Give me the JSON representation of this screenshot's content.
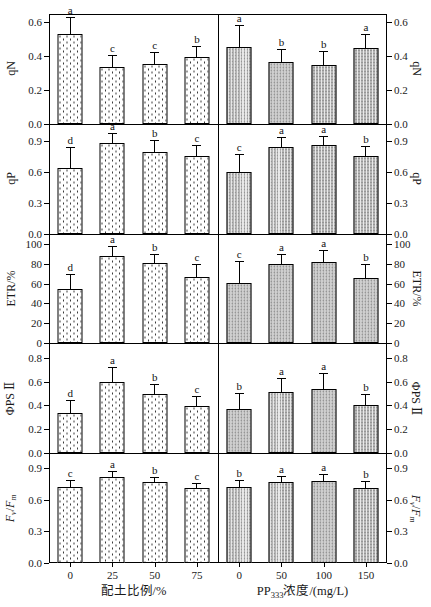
{
  "figure": {
    "width": 431,
    "height": 607,
    "background": "#ffffff",
    "colors": {
      "axis": "#000000",
      "text": "#1a1a1a",
      "left_bar_fill": "#ffffff",
      "left_bar_dot": "#3a3a3a",
      "right_bar_fill": "#b4b4b4",
      "right_bar_texture": "#9a9a9a"
    }
  },
  "chart_data": {
    "type": "bar",
    "grid": false,
    "legend": null,
    "geometry": {
      "plot_left": 49,
      "plot_top": 14,
      "plot_width": 338,
      "plot_height": 549,
      "bar_width": 25,
      "tick_len": 5,
      "x_tick_len": 4
    },
    "x_axes": [
      {
        "side": "left",
        "title_parts": [
          {
            "t": "配土比例/%"
          }
        ],
        "categories": [
          "0",
          "25",
          "50",
          "75"
        ]
      },
      {
        "side": "right",
        "title_parts": [
          {
            "t": "PP"
          },
          {
            "t": "333",
            "sub": true
          },
          {
            "t": "浓度/(mg/L)"
          }
        ],
        "categories": [
          "0",
          "50",
          "100",
          "150"
        ]
      }
    ],
    "panels": [
      {
        "ylabel_parts": [
          {
            "t": "qN"
          }
        ],
        "ticks": [
          "0.0",
          "0.2",
          "0.4",
          "0.6"
        ],
        "tick_values": [
          0,
          0.2,
          0.4,
          0.6
        ],
        "ymax": 0.645,
        "series": [
          {
            "x_axis": "left",
            "values": [
              0.53,
              0.335,
              0.35,
              0.395
            ],
            "errors": [
              0.09,
              0.065,
              0.065,
              0.055
            ],
            "letters": [
              "a",
              "c",
              "c",
              "b"
            ]
          },
          {
            "x_axis": "right",
            "values": [
              0.45,
              0.365,
              0.345,
              0.445
            ],
            "errors": [
              0.125,
              0.07,
              0.075,
              0.075
            ],
            "letters": [
              "a",
              "b",
              "b",
              "a"
            ]
          }
        ]
      },
      {
        "ylabel_parts": [
          {
            "t": "qP"
          }
        ],
        "ticks": [
          "0.0",
          "0.3",
          "0.6",
          "0.9"
        ],
        "tick_values": [
          0,
          0.3,
          0.6,
          0.9
        ],
        "ymax": 1.07,
        "series": [
          {
            "x_axis": "left",
            "values": [
              0.64,
              0.88,
              0.8,
              0.76
            ],
            "errors": [
              0.19,
              0.09,
              0.1,
              0.09
            ],
            "letters": [
              "d",
              "a",
              "b",
              "c"
            ]
          },
          {
            "x_axis": "right",
            "values": [
              0.6,
              0.84,
              0.86,
              0.76
            ],
            "errors": [
              0.17,
              0.09,
              0.08,
              0.08
            ],
            "letters": [
              "c",
              "a",
              "a",
              "b"
            ]
          }
        ]
      },
      {
        "ylabel_parts": [
          {
            "t": "ETR/%"
          }
        ],
        "ticks": [
          "0",
          "20",
          "40",
          "60",
          "80",
          "100"
        ],
        "tick_values": [
          0,
          20,
          40,
          60,
          80,
          100
        ],
        "ymax": 110,
        "series": [
          {
            "x_axis": "left",
            "values": [
              55,
              88,
              81,
              67
            ],
            "errors": [
              14,
              9,
              8,
              12
            ],
            "letters": [
              "d",
              "a",
              "b",
              "c"
            ]
          },
          {
            "x_axis": "right",
            "values": [
              61,
              80,
              82,
              66
            ],
            "errors": [
              21,
              9,
              11,
              13
            ],
            "letters": [
              "c",
              "a",
              "a",
              "b"
            ]
          }
        ]
      },
      {
        "ylabel_parts": [
          {
            "t": "ΦPS Ⅱ"
          }
        ],
        "ticks": [
          "0.0",
          "0.2",
          "0.4",
          "0.6",
          "0.8"
        ],
        "tick_values": [
          0,
          0.2,
          0.4,
          0.6,
          0.8
        ],
        "ymax": 0.92,
        "series": [
          {
            "x_axis": "left",
            "values": [
              0.34,
              0.6,
              0.5,
              0.395
            ],
            "errors": [
              0.1,
              0.11,
              0.07,
              0.08
            ],
            "letters": [
              "d",
              "a",
              "b",
              "c"
            ]
          },
          {
            "x_axis": "right",
            "values": [
              0.37,
              0.51,
              0.54,
              0.4
            ],
            "errors": [
              0.125,
              0.115,
              0.12,
              0.085
            ],
            "letters": [
              "b",
              "a",
              "a",
              "b"
            ]
          }
        ]
      },
      {
        "ylabel_parts": [
          {
            "t": "F",
            "i": true
          },
          {
            "t": "v",
            "sub": true,
            "i": true
          },
          {
            "t": "/"
          },
          {
            "t": "F",
            "i": true
          },
          {
            "t": "m",
            "sub": true,
            "i": true
          }
        ],
        "ticks": [
          "0.0",
          "0.3",
          "0.6",
          "0.9"
        ],
        "tick_values": [
          0,
          0.3,
          0.6,
          0.9
        ],
        "ymax": 1.04,
        "series": [
          {
            "x_axis": "left",
            "values": [
              0.72,
              0.81,
              0.765,
              0.71
            ],
            "errors": [
              0.06,
              0.05,
              0.04,
              0.04
            ],
            "letters": [
              "c",
              "a",
              "b",
              "c"
            ]
          },
          {
            "x_axis": "right",
            "values": [
              0.72,
              0.765,
              0.78,
              0.71
            ],
            "errors": [
              0.06,
              0.045,
              0.05,
              0.055
            ],
            "letters": [
              "b",
              "a",
              "a",
              "b"
            ]
          }
        ]
      }
    ]
  }
}
